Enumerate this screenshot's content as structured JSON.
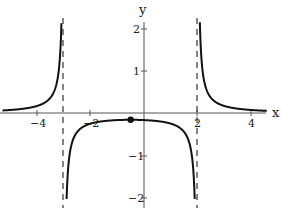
{
  "chart_data": {
    "type": "line",
    "title": "",
    "function_description": "Rational function with vertical asymptotes at x = -3 and x = 2, horizontal asymptote y = 0, local maximum marked near x = -0.5",
    "xlabel": "x",
    "ylabel": "y",
    "xlim": [
      -5.3,
      4.6
    ],
    "ylim": [
      -2.2,
      2.2
    ],
    "x_ticks": [
      -4,
      -2,
      2,
      4
    ],
    "x_tick_labels": [
      "-4",
      "-2",
      "2",
      "4"
    ],
    "y_ticks": [
      -2,
      -1,
      1,
      2
    ],
    "y_tick_labels": [
      "-2",
      "-1",
      "1",
      "2"
    ],
    "grid": false,
    "vertical_asymptotes": [
      -3,
      2
    ],
    "horizontal_asymptote": 0,
    "marked_point": {
      "x": -0.5,
      "y": -0.16
    },
    "series": [
      {
        "name": "left branch",
        "x": [
          -5.3,
          -5,
          -4.5,
          -4,
          -3.5,
          -3.3,
          -3.2,
          -3.1
        ],
        "y": [
          0.06,
          0.07,
          0.1,
          0.17,
          0.36,
          0.63,
          0.96,
          1.96
        ]
      },
      {
        "name": "middle branch",
        "x": [
          -2.9,
          -2.8,
          -2.5,
          -2,
          -1,
          -0.5,
          0,
          1,
          1.5,
          1.8,
          1.9
        ],
        "y": [
          -2.04,
          -1.04,
          -0.44,
          -0.25,
          -0.17,
          -0.16,
          -0.17,
          -0.25,
          -0.44,
          -1.04,
          -2.04
        ]
      },
      {
        "name": "right branch",
        "x": [
          2.1,
          2.2,
          2.3,
          2.5,
          3,
          3.5,
          4,
          4.5
        ],
        "y": [
          1.96,
          0.96,
          0.63,
          0.36,
          0.17,
          0.1,
          0.07,
          0.05
        ]
      }
    ]
  },
  "labels": {
    "x_axis": "x",
    "y_axis": "y",
    "x_ticks": [
      "-4",
      "-2",
      "2",
      "4"
    ],
    "y_ticks": [
      "2",
      "1",
      "-1",
      "-2"
    ]
  }
}
